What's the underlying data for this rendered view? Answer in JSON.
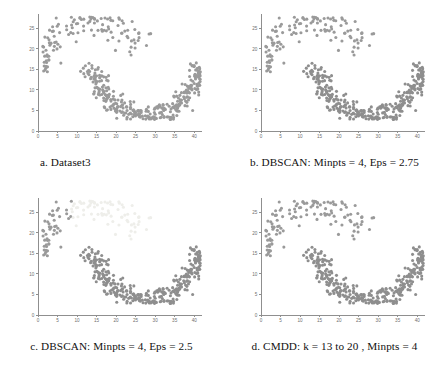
{
  "figure": {
    "title": "",
    "panel_count": 4,
    "background_color": "#ffffff"
  },
  "panels": [
    {
      "id": "a",
      "caption": "a.   Dataset3",
      "cluster_colors": [
        "#9a9a9a",
        "#9a9a9a"
      ],
      "noise_color": "#9a9a9a"
    },
    {
      "id": "b",
      "caption": "b. DBSCAN: Minpts = 4, Eps = 2.75",
      "cluster_colors": [
        "#9a9a9a",
        "#8e8e8e"
      ],
      "noise_color": "#9a9a9a"
    },
    {
      "id": "c",
      "caption": "c. DBSCAN: Minpts = 4, Eps = 2.5",
      "cluster_colors": [
        "#9a9a9a",
        "#eeeeea"
      ],
      "noise_color": "#9a9a9a"
    },
    {
      "id": "d",
      "caption": "d. CMDD: k = 13 to 20 , Minpts = 4",
      "cluster_colors": [
        "#9a9a9a",
        "#8e8e8e"
      ],
      "noise_color": "#9a9a9a"
    }
  ],
  "footer": {
    "note": ""
  },
  "chart_data": {
    "type": "scatter",
    "title": "",
    "xlabel": "",
    "ylabel": "",
    "xlim": [
      0,
      42
    ],
    "ylim": [
      0,
      28.5
    ],
    "xticks": [
      0,
      5,
      10,
      15,
      20,
      25,
      30,
      35,
      40
    ],
    "yticks": [
      0,
      5,
      10,
      15,
      20,
      25
    ],
    "grid": false,
    "legend": null,
    "marker_size": 1.55,
    "panels": [
      {
        "id": "a",
        "caption": "a.   Dataset3",
        "series": [
          {
            "name": "upper-moon",
            "color": "#9a9a9a",
            "shape": "upper-crescent",
            "n": 118,
            "description": "Sparse upper-left to upper-right arc peaking near y=27 around x=13, sweeping down to y=15 near x=22",
            "x": [
              2.2,
              3.0,
              3.4,
              4.1,
              4.4,
              4.8,
              5.0,
              5.3,
              5.6,
              5.9,
              6.1,
              6.4,
              6.6,
              6.9,
              7.2,
              7.4,
              7.8,
              3.8,
              4.6,
              5.2,
              2.6,
              3.3,
              6.8,
              7.5,
              8.1,
              8.6,
              9.2,
              9.8,
              10.4,
              11.0,
              11.5,
              12.1,
              12.7,
              13.2,
              13.8,
              14.3,
              14.9,
              15.4,
              16.0,
              16.6,
              17.1,
              17.7,
              18.2,
              18.8,
              19.3,
              19.9,
              20.4,
              21.0,
              21.5,
              22.1,
              10.8,
              11.9,
              12.5,
              13.5,
              14.6,
              15.8,
              16.9,
              18.0,
              19.1,
              20.2,
              21.3,
              22.4,
              9.5,
              10.1,
              12.9,
              14.0,
              15.1,
              16.2,
              17.4,
              18.5,
              19.6,
              20.7,
              21.8,
              23.0,
              23.5,
              24.1,
              24.6,
              25.2,
              25.7,
              22.8,
              23.9,
              24.9,
              26.0,
              26.6,
              11.3,
              12.3,
              13.1,
              14.8,
              15.6,
              17.0,
              18.3,
              19.8,
              20.9,
              22.3,
              23.3,
              24.3,
              2.8,
              4.0,
              5.5,
              6.3,
              7.0,
              7.9,
              8.4,
              3.6,
              4.9,
              6.0,
              26.2,
              25.5,
              24.8,
              23.7,
              22.6,
              21.6,
              20.5,
              19.4,
              18.4,
              17.3,
              16.4,
              15.3,
              14.2
            ],
            "y": [
              18.4,
              20.2,
              21.6,
              22.8,
              23.1,
              21.9,
              20.6,
              19.4,
              18.1,
              16.9,
              15.8,
              15.2,
              16.4,
              17.6,
              18.9,
              20.1,
              21.3,
              23.9,
              24.4,
              22.4,
              19.1,
              17.2,
              22.6,
              23.4,
              24.6,
              25.3,
              26.1,
              26.8,
              27.3,
              27.0,
              26.4,
              27.2,
              26.6,
              25.9,
              25.1,
              24.4,
              23.6,
              22.9,
              22.1,
              21.4,
              20.6,
              19.9,
              19.1,
              18.4,
              17.6,
              16.9,
              16.1,
              15.4,
              14.8,
              15.6,
              25.6,
              24.8,
              23.5,
              22.2,
              21.0,
              20.3,
              19.5,
              18.8,
              18.0,
              17.3,
              16.5,
              16.2,
              25.0,
              23.9,
              24.0,
              23.2,
              24.2,
              23.1,
              21.8,
              20.4,
              19.2,
              17.9,
              17.1,
              18.6,
              19.8,
              20.9,
              21.7,
              22.5,
              21.2,
              17.4,
              16.6,
              15.9,
              20.0,
              18.7,
              22.0,
              21.1,
              20.4,
              21.5,
              20.8,
              22.3,
              21.6,
              20.1,
              19.3,
              18.2,
              22.0,
              20.8,
              19.6,
              18.3,
              17.4,
              16.2,
              15.4,
              22.1,
              21.0,
              19.8,
              19.1,
              18.0,
              17.2,
              16.4,
              15.7,
              15.0,
              14.6,
              15.1,
              15.9,
              16.8,
              17.7,
              18.6
            ]
          },
          {
            "name": "lower-moon",
            "color": "#9a9a9a",
            "shape": "lower-crescent",
            "n": 312,
            "description": "Dense U-shaped crescent from (16,17) down through minimum (27,3.5) and up to (41,17)",
            "x_range": [
              15.5,
              41.5
            ],
            "y_range": [
              3.0,
              17.5
            ],
            "density": "high"
          }
        ]
      },
      {
        "id": "b",
        "caption": "b. DBSCAN: Minpts = 4, Eps = 2.75",
        "series": [
          {
            "name": "cluster-1-upper",
            "color": "#9a9a9a",
            "shape": "upper-crescent",
            "n": 118
          },
          {
            "name": "cluster-2-lower",
            "color": "#8e8e8e",
            "shape": "lower-crescent",
            "n": 312
          }
        ]
      },
      {
        "id": "c",
        "caption": "c. DBSCAN: Minpts = 4, Eps = 2.5",
        "series": [
          {
            "name": "cluster-1-left-noise",
            "color": "#9a9a9a",
            "shape": "upper-crescent-left",
            "n": 40
          },
          {
            "name": "cluster-2-upper-light",
            "color": "#eeeeea",
            "shape": "upper-crescent-right",
            "n": 78
          },
          {
            "name": "cluster-3-lower",
            "color": "#8e8e8e",
            "shape": "lower-crescent",
            "n": 312
          }
        ]
      },
      {
        "id": "d",
        "caption": "d. CMDD: k = 13 to 20 , Minpts = 4",
        "series": [
          {
            "name": "cluster-1-upper",
            "color": "#9a9a9a",
            "shape": "upper-crescent",
            "n": 118
          },
          {
            "name": "cluster-2-lower",
            "color": "#8e8e8e",
            "shape": "lower-crescent",
            "n": 312
          }
        ]
      }
    ]
  }
}
